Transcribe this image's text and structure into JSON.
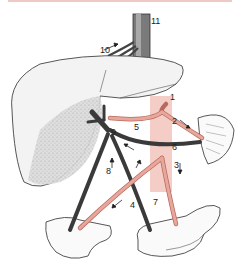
{
  "figure": {
    "labels": [
      {
        "id": "1",
        "text": "1"
      },
      {
        "id": "2",
        "text": "2"
      },
      {
        "id": "3",
        "text": "3"
      },
      {
        "id": "4",
        "text": "4"
      },
      {
        "id": "5",
        "text": "5"
      },
      {
        "id": "6",
        "text": "6"
      },
      {
        "id": "7",
        "text": "7"
      },
      {
        "id": "8",
        "text": "8"
      },
      {
        "id": "9",
        "text": "9"
      },
      {
        "id": "10",
        "text": "10"
      },
      {
        "id": "11",
        "text": "11"
      }
    ],
    "colors": {
      "artery": "#e8a79c",
      "artery_stroke": "#b86a5e",
      "vein": "#3a3a3a",
      "aorta_band": "#f3cdc6",
      "organ_fill": "#f3f3f3",
      "organ_stroke": "#444444",
      "top_band": "#f1c9c4"
    }
  }
}
